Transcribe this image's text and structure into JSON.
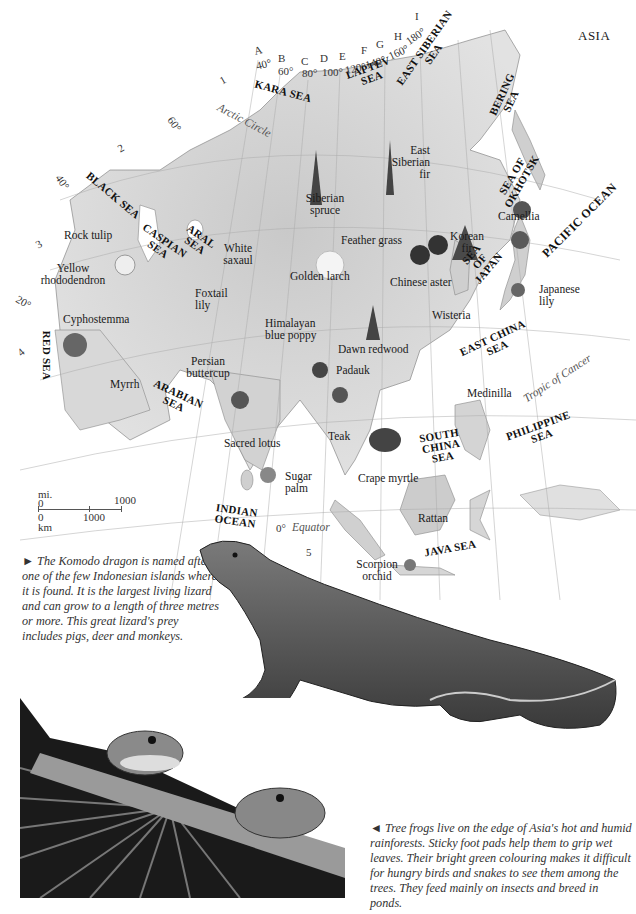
{
  "page": {
    "title": "ASIA"
  },
  "map": {
    "grid_letters": [
      {
        "id": "A",
        "lon": "40°"
      },
      {
        "id": "B",
        "lon": "60°"
      },
      {
        "id": "C",
        "lon": "80°"
      },
      {
        "id": "D",
        "lon": "100°"
      },
      {
        "id": "E",
        "lon": "120°"
      },
      {
        "id": "F",
        "lon": "140°"
      },
      {
        "id": "G",
        "lon": "160°"
      },
      {
        "id": "H",
        "lon": ""
      },
      {
        "id": "I",
        "lon": "180°"
      }
    ],
    "grid_numbers": [
      "1",
      "2",
      "3",
      "4",
      "5"
    ],
    "latitudes": [
      "60°",
      "40°",
      "20°",
      "0°"
    ],
    "lines": {
      "arctic": "Arctic Circle",
      "cancer": "Tropic of Cancer",
      "equator": "Equator"
    },
    "seas": {
      "kara": "KARA SEA",
      "laptev": "LAPTEV SEA",
      "east_siberian": "EAST SIBERIAN SEA",
      "bering": "BERING SEA",
      "okhotsk": "SEA OF OKHOTSK",
      "black": "BLACK SEA",
      "caspian": "CASPIAN SEA",
      "aral": "ARAL SEA",
      "japan": "SEA OF JAPAN",
      "pacific": "PACIFIC OCEAN",
      "red": "RED SEA",
      "east_china": "EAST CHINA SEA",
      "arabian": "ARABIAN SEA",
      "south_china": "SOUTH CHINA SEA",
      "philippine": "PHILIPPINE SEA",
      "indian": "INDIAN OCEAN",
      "java": "JAVA SEA"
    },
    "plants": {
      "east_siberian_fir": "East Siberian fir",
      "siberian_spruce": "Siberian spruce",
      "camellia": "Camellia",
      "rock_tulip": "Rock tulip",
      "white_saxaul": "White saxaul",
      "feather_grass": "Feather grass",
      "korean_fir": "Korean fir",
      "yellow_rhododendron": "Yellow rhododendron",
      "golden_larch": "Golden larch",
      "chinese_aster": "Chinese aster",
      "japanese_lily": "Japanese lily",
      "foxtail_lily": "Foxtail lily",
      "wisteria": "Wisteria",
      "cyphostemma": "Cyphostemma",
      "himalayan_blue_poppy": "Himalayan blue poppy",
      "dawn_redwood": "Dawn redwood",
      "persian_buttercup": "Persian buttercup",
      "padauk": "Padauk",
      "myrrh": "Myrrh",
      "medinilla": "Medinilla",
      "sacred_lotus": "Sacred lotus",
      "teak": "Teak",
      "crape_myrtle": "Crape myrtle",
      "sugar_palm": "Sugar palm",
      "rattan": "Rattan",
      "scorpion_orchid": "Scorpion orchid"
    },
    "scale": {
      "mi_label": "mi.",
      "mi_zero": "0",
      "mi_max": "1000",
      "km_zero": "0",
      "km_mid": "1000",
      "km_label": "km"
    }
  },
  "captions": {
    "komodo": "► The Komodo dragon is named after one of the few Indonesian islands where it is found. It is the largest living lizard and can grow to a length of three metres or more. This great lizard's prey includes pigs, deer and monkeys.",
    "frogs": "◄ Tree frogs live on the edge of Asia's hot and humid rainforests. Sticky foot pads help them to grip wet leaves. Their bright green colouring makes it difficult for hungry birds and snakes to see them among the trees. They feed mainly on insects and breed in ponds."
  },
  "colors": {
    "land": "#d9d9d9",
    "land_dark": "#b8b8b8",
    "line": "#9a9a9a",
    "ink": "#1a1a1a"
  }
}
